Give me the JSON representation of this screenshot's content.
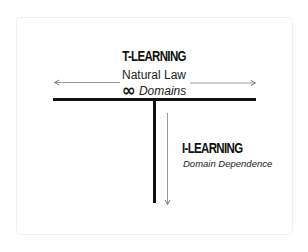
{
  "diagram": {
    "t_learning": {
      "title": "T-LEARNING",
      "subtitle": "Natural Law",
      "infinity_symbol": "∞",
      "domains_label": "Domains"
    },
    "i_learning": {
      "title": "I-LEARNING",
      "subtitle": "Domain Dependence"
    },
    "arrows": {
      "horizontal": "bidirectional (left ↔ right)",
      "vertical": "downward"
    },
    "colors": {
      "bar": "#111111",
      "arrow": "#9a9a9a",
      "card_border": "#e2e2e2",
      "background": "#ffffff"
    }
  }
}
